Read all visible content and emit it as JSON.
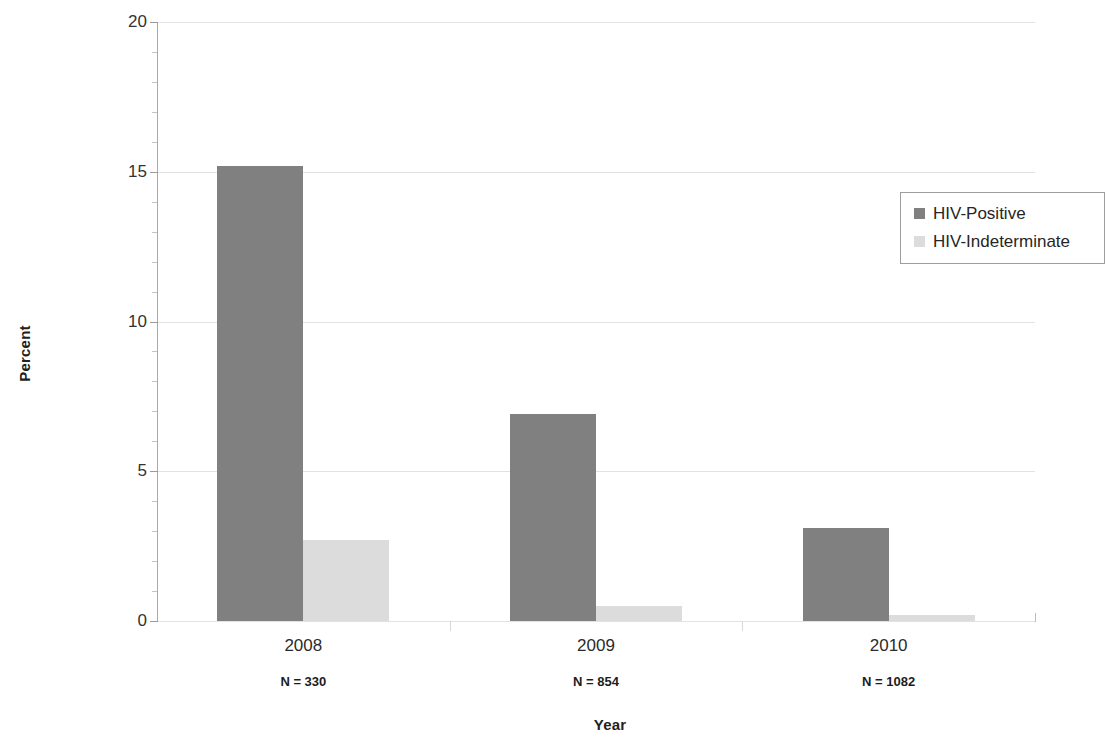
{
  "chart_data": {
    "type": "bar",
    "title": "",
    "xlabel": "Year",
    "ylabel": "Percent",
    "categories": [
      "2008",
      "2009",
      "2010"
    ],
    "category_notes": [
      "N = 330",
      "N = 854",
      "N = 1082"
    ],
    "series": [
      {
        "name": "HIV-Positive",
        "color": "#808080",
        "values": [
          15.2,
          6.9,
          3.1
        ]
      },
      {
        "name": "HIV-Indeterminate",
        "color": "#dcdcdc",
        "values": [
          2.7,
          0.5,
          0.2
        ]
      }
    ],
    "ylim": [
      0,
      20
    ],
    "ytick_labels": [
      "0",
      "5",
      "10",
      "15",
      "20"
    ],
    "ytick_values": [
      0,
      5,
      10,
      15,
      20
    ],
    "yminor_step": 1,
    "grid": "horizontal",
    "legend_position": "top-right"
  },
  "axes": {
    "y_label": "Percent",
    "x_label": "Year"
  },
  "legend": {
    "items": [
      {
        "label": "HIV-Positive",
        "color": "#808080"
      },
      {
        "label": "HIV-Indeterminate",
        "color": "#dcdcdc"
      }
    ]
  },
  "ticks": {
    "y": [
      "0",
      "5",
      "10",
      "15",
      "20"
    ]
  },
  "categories": [
    {
      "label": "2008",
      "note": "N = 330"
    },
    {
      "label": "2009",
      "note": "N = 854"
    },
    {
      "label": "2010",
      "note": "N = 1082"
    }
  ]
}
